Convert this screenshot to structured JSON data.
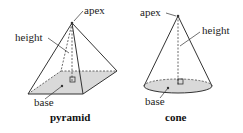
{
  "pyramid": {
    "title": "pyramid",
    "labels": {
      "apex": "apex",
      "height": "height",
      "base": "base"
    }
  },
  "cone": {
    "title": "cone",
    "labels": {
      "apex": "apex",
      "height": "height",
      "base": "base"
    }
  },
  "colors": {
    "base_fill": "#d9d9d9",
    "line": "#333333"
  }
}
